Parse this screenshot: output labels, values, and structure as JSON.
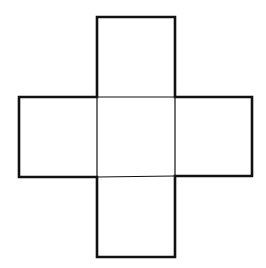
{
  "diagram": {
    "type": "cross-net",
    "stroke_color": "#111111",
    "background": "#ffffff",
    "squares": [
      {
        "name": "top",
        "x": 97,
        "y": 17,
        "size": 79
      },
      {
        "name": "left",
        "x": 19,
        "y": 97,
        "size": 78
      },
      {
        "name": "center",
        "x": 97,
        "y": 97,
        "size": 79
      },
      {
        "name": "right",
        "x": 176,
        "y": 97,
        "size": 76
      },
      {
        "name": "bottom",
        "x": 97,
        "y": 177,
        "size": 79
      }
    ]
  }
}
